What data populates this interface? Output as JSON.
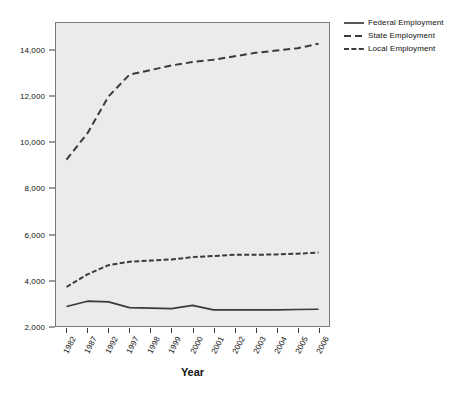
{
  "chart_data": {
    "type": "line",
    "title": "",
    "xlabel": "Year",
    "ylabel": "",
    "grid": false,
    "legend_position": "right",
    "categories": [
      "1982",
      "1987",
      "1992",
      "1997",
      "1998",
      "1999",
      "2000",
      "2001",
      "2002",
      "2003",
      "2004",
      "2005",
      "2006"
    ],
    "ylim": [
      2000,
      15200
    ],
    "yticks": [
      2000,
      4000,
      6000,
      8000,
      10000,
      12000,
      14000
    ],
    "ytick_labels": [
      "2,000",
      "4,000",
      "6,000",
      "8,000",
      "10,000",
      "12,000",
      "14,000"
    ],
    "series": [
      {
        "name": "Federal Employment",
        "style": "solid",
        "color": "#3a3a3a",
        "values": [
          2850,
          3080,
          3050,
          2800,
          2780,
          2760,
          2900,
          2700,
          2700,
          2700,
          2700,
          2720,
          2730
        ]
      },
      {
        "name": "State Employment",
        "style": "dashed",
        "color": "#3a3a3a",
        "values": [
          9250,
          10400,
          12000,
          12950,
          13150,
          13350,
          13500,
          13600,
          13750,
          13900,
          14000,
          14100,
          14300
        ]
      },
      {
        "name": "Local Employment",
        "style": "dash-dot",
        "color": "#3a3a3a",
        "values": [
          3700,
          4250,
          4650,
          4800,
          4850,
          4900,
          5000,
          5050,
          5100,
          5100,
          5120,
          5150,
          5200
        ]
      }
    ]
  },
  "legend": {
    "items": [
      {
        "label": "Federal Employment",
        "style": "solid"
      },
      {
        "label": "State Employment",
        "style": "dashed"
      },
      {
        "label": "Local Employment",
        "style": "dash-dot"
      }
    ]
  },
  "axis": {
    "x_title": "Year"
  },
  "colors": {
    "plot_background": "#ebebeb",
    "plot_border": "#7a7a7a",
    "line": "#3a3a3a",
    "text": "#111111",
    "page_background": "#ffffff"
  }
}
